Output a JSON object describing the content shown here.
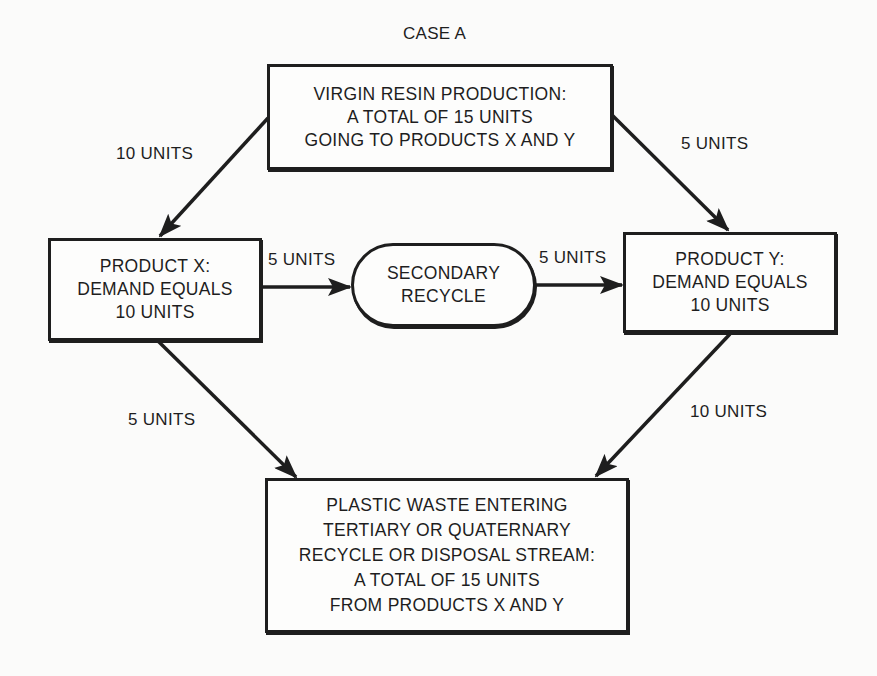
{
  "title": "CASE A",
  "nodes": {
    "virgin": {
      "lines": [
        "VIRGIN RESIN PRODUCTION:",
        "A TOTAL OF 15 UNITS",
        "GOING TO PRODUCTS X AND Y"
      ]
    },
    "product_x": {
      "lines": [
        "PRODUCT X:",
        "DEMAND EQUALS",
        "10 UNITS"
      ]
    },
    "secondary": {
      "lines": [
        "SECONDARY",
        "RECYCLE"
      ]
    },
    "product_y": {
      "lines": [
        "PRODUCT Y:",
        "DEMAND EQUALS",
        "10 UNITS"
      ]
    },
    "waste": {
      "lines": [
        "PLASTIC WASTE ENTERING",
        "TERTIARY OR QUATERNARY",
        "RECYCLE OR DISPOSAL STREAM:",
        "A TOTAL OF 15 UNITS",
        "FROM PRODUCTS X AND Y"
      ]
    }
  },
  "edges": {
    "virgin_to_x": "10 UNITS",
    "virgin_to_y": "5 UNITS",
    "x_to_secondary": "5 UNITS",
    "secondary_to_y": "5 UNITS",
    "x_to_waste": "5 UNITS",
    "y_to_waste": "10 UNITS"
  },
  "colors": {
    "ink": "#1e1e1e",
    "paper": "#fbfbfa"
  }
}
